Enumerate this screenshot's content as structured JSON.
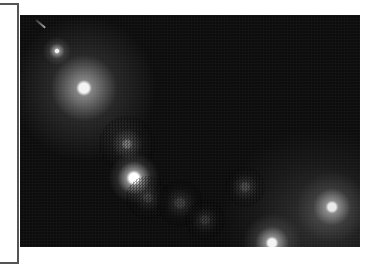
{
  "image": {
    "description": "Dark night-sky / bokeh photograph with scattered bright light points",
    "background_color": "#0c0c0c",
    "frame_color": "#555555",
    "spots": [
      {
        "name": "small-star",
        "x": 37,
        "y": 36,
        "size": 8,
        "intensity": 1.0,
        "glow": 10
      },
      {
        "name": "large-glow-top-left",
        "x": 64,
        "y": 73,
        "size": 22,
        "intensity": 0.95,
        "glow": 60
      },
      {
        "name": "dim-mid",
        "x": 107,
        "y": 129,
        "size": 16,
        "intensity": 0.45,
        "glow": 20
      },
      {
        "name": "bright-disc",
        "x": 114,
        "y": 163,
        "size": 22,
        "intensity": 1.0,
        "glow": 14
      },
      {
        "name": "faint-below-disc",
        "x": 128,
        "y": 183,
        "size": 16,
        "intensity": 0.2,
        "glow": 14
      },
      {
        "name": "faint-center-1",
        "x": 160,
        "y": 188,
        "size": 18,
        "intensity": 0.22,
        "glow": 14
      },
      {
        "name": "faint-center-2",
        "x": 185,
        "y": 205,
        "size": 16,
        "intensity": 0.18,
        "glow": 12
      },
      {
        "name": "faint-center-3",
        "x": 225,
        "y": 172,
        "size": 16,
        "intensity": 0.25,
        "glow": 12
      },
      {
        "name": "bright-bottom-edge",
        "x": 252,
        "y": 228,
        "size": 18,
        "intensity": 0.95,
        "glow": 20
      },
      {
        "name": "bright-right",
        "x": 312,
        "y": 192,
        "size": 18,
        "intensity": 0.9,
        "glow": 26
      }
    ]
  }
}
